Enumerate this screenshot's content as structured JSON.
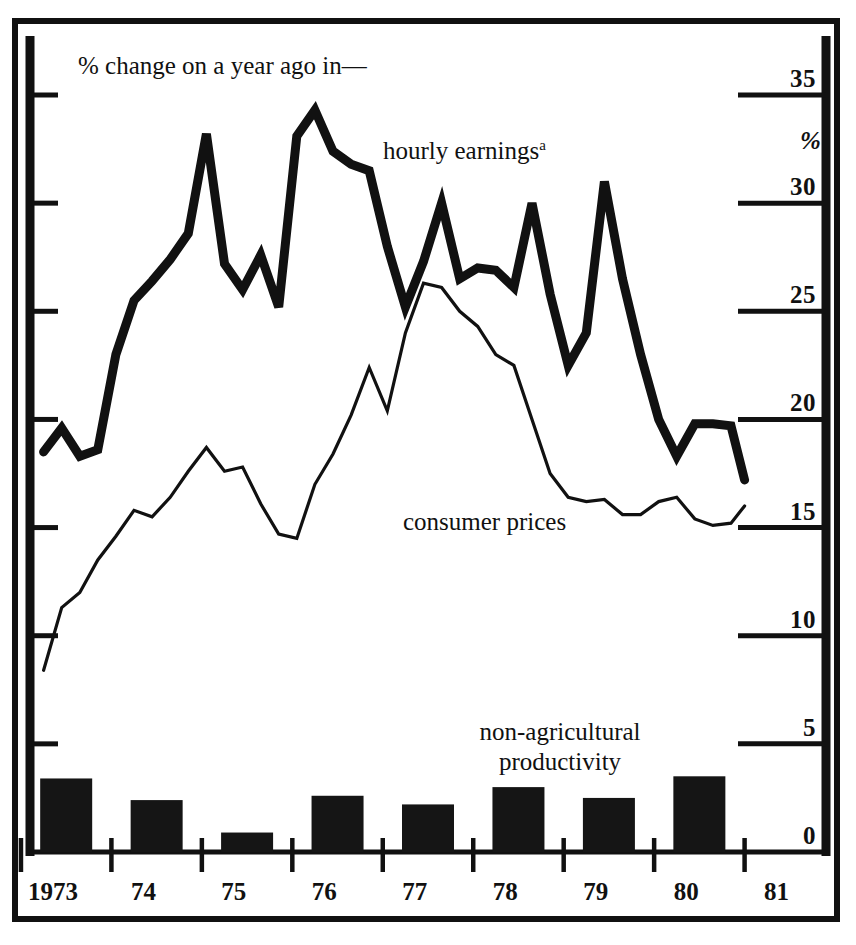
{
  "figure": {
    "caption": "% change on a year ago in—",
    "background": "#ffffff",
    "ink_color": "#111111"
  },
  "labels": {
    "hourly_earnings": "hourly earnings",
    "hourly_earnings_footnote": "a",
    "consumer_prices": "consumer prices",
    "productivity_line1": "non-agricultural",
    "productivity_line2": "productivity",
    "percent_symbol": "%"
  },
  "chart_data": {
    "type": "line",
    "title": "% change on a year ago in—",
    "subtitle": "",
    "xlabel": "",
    "ylabel": "%",
    "ylim": [
      0,
      35
    ],
    "yticks": [
      0,
      5,
      10,
      15,
      20,
      25,
      30,
      35
    ],
    "ytick_labels": [
      "0",
      "5",
      "10",
      "15",
      "20",
      "25",
      "30",
      "35"
    ],
    "y_axis_side": "right",
    "grid": false,
    "legend": "inline-annotations",
    "x_axis": {
      "tick_labels": [
        "1973",
        "74",
        "75",
        "76",
        "77",
        "78",
        "79",
        "80",
        "81"
      ],
      "tick_years": [
        1973,
        1974,
        1975,
        1976,
        1977,
        1978,
        1979,
        1980,
        1981
      ],
      "range": [
        1972.6,
        1981.4
      ]
    },
    "series": [
      {
        "name": "hourly earnings",
        "style": "thick-line",
        "footnote": "a",
        "x": [
          1972.75,
          1972.95,
          1973.15,
          1973.35,
          1973.55,
          1973.75,
          1973.95,
          1974.15,
          1974.35,
          1974.55,
          1974.75,
          1974.95,
          1975.15,
          1975.35,
          1975.55,
          1975.75,
          1975.95,
          1976.15,
          1976.35,
          1976.55,
          1976.75,
          1976.95,
          1977.15,
          1977.35,
          1977.55,
          1977.75,
          1977.95,
          1978.15,
          1978.35,
          1978.55,
          1978.75,
          1978.95,
          1979.15,
          1979.35,
          1979.55,
          1979.75,
          1979.95,
          1980.15,
          1980.35,
          1980.5
        ],
        "values": [
          18.5,
          19.6,
          18.3,
          18.6,
          23.0,
          25.5,
          26.4,
          27.4,
          28.6,
          33.2,
          27.2,
          26.0,
          27.6,
          25.2,
          33.1,
          34.3,
          32.4,
          31.8,
          31.5,
          28.0,
          25.2,
          27.3,
          30.0,
          26.5,
          27.0,
          26.9,
          26.1,
          30.0,
          25.8,
          22.5,
          24.0,
          31.0,
          26.5,
          23.0,
          20.0,
          18.3,
          19.8,
          19.8,
          19.7,
          17.2
        ]
      },
      {
        "name": "consumer prices",
        "style": "thin-line",
        "x": [
          1972.75,
          1972.95,
          1973.15,
          1973.35,
          1973.55,
          1973.75,
          1973.95,
          1974.15,
          1974.35,
          1974.55,
          1974.75,
          1974.95,
          1975.15,
          1975.35,
          1975.55,
          1975.75,
          1975.95,
          1976.15,
          1976.35,
          1976.55,
          1976.75,
          1976.95,
          1977.15,
          1977.35,
          1977.55,
          1977.75,
          1977.95,
          1978.15,
          1978.35,
          1978.55,
          1978.75,
          1978.95,
          1979.15,
          1979.35,
          1979.55,
          1979.75,
          1979.95,
          1980.15,
          1980.35,
          1980.5
        ],
        "values": [
          8.4,
          11.3,
          12.0,
          13.5,
          14.6,
          15.8,
          15.5,
          16.4,
          17.6,
          18.7,
          17.6,
          17.8,
          16.1,
          14.7,
          14.5,
          17.0,
          18.4,
          20.2,
          22.4,
          20.4,
          24.0,
          26.3,
          26.1,
          25.0,
          24.3,
          23.0,
          22.5,
          20.0,
          17.5,
          16.4,
          16.2,
          16.3,
          15.6,
          15.6,
          16.2,
          16.4,
          15.4,
          15.1,
          15.2,
          16.0
        ]
      },
      {
        "name": "non-agricultural productivity",
        "style": "bars",
        "categories": [
          "1973",
          "1974",
          "1975",
          "1976",
          "1977",
          "1978",
          "1979",
          "1980"
        ],
        "values": [
          3.4,
          2.4,
          0.9,
          2.6,
          2.2,
          3.0,
          2.5,
          3.5
        ]
      }
    ]
  }
}
